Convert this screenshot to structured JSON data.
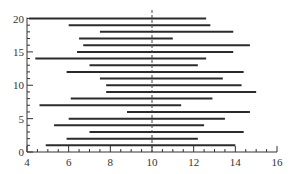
{
  "chart_data": {
    "type": "interval",
    "title": "",
    "xlabel": "",
    "ylabel": "",
    "xlim": [
      4,
      16
    ],
    "ylim": [
      0,
      20
    ],
    "x_ticks": [
      4,
      6,
      8,
      10,
      12,
      14,
      16
    ],
    "y_ticks": [
      0,
      5,
      10,
      15,
      20
    ],
    "x_minor_step": 0.5,
    "y_minor_step": 1,
    "grid": false,
    "reference_line": {
      "x": 10,
      "style": "dashed"
    },
    "intervals": [
      {
        "y": 1,
        "low": 4.9,
        "high": 14.0
      },
      {
        "y": 2,
        "low": 5.9,
        "high": 12.2
      },
      {
        "y": 3,
        "low": 7.0,
        "high": 14.4
      },
      {
        "y": 4,
        "low": 5.3,
        "high": 12.5
      },
      {
        "y": 5,
        "low": 6.0,
        "high": 13.5
      },
      {
        "y": 6,
        "low": 8.8,
        "high": 14.7
      },
      {
        "y": 7,
        "low": 4.6,
        "high": 11.4
      },
      {
        "y": 8,
        "low": 6.1,
        "high": 12.9
      },
      {
        "y": 9,
        "low": 7.8,
        "high": 15.0
      },
      {
        "y": 10,
        "low": 7.8,
        "high": 14.3
      },
      {
        "y": 11,
        "low": 7.5,
        "high": 13.4
      },
      {
        "y": 12,
        "low": 5.9,
        "high": 14.4
      },
      {
        "y": 13,
        "low": 7.0,
        "high": 12.2
      },
      {
        "y": 14,
        "low": 4.4,
        "high": 12.6
      },
      {
        "y": 15,
        "low": 6.4,
        "high": 13.9
      },
      {
        "y": 16,
        "low": 6.7,
        "high": 14.7
      },
      {
        "y": 17,
        "low": 6.5,
        "high": 11.0
      },
      {
        "y": 18,
        "low": 7.5,
        "high": 13.9
      },
      {
        "y": 19,
        "low": 6.0,
        "high": 12.8
      },
      {
        "y": 20,
        "low": 4.1,
        "high": 12.6
      }
    ],
    "colors": {
      "line": "#2b2b2b",
      "axis": "#333333",
      "reference": "#444444"
    }
  }
}
